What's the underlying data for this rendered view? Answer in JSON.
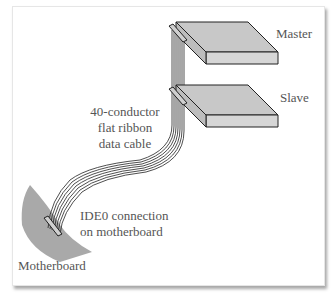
{
  "diagram": {
    "labels": {
      "master": "Master",
      "slave": "Slave",
      "cable_line1": "40-conductor",
      "cable_line2": "flat ribbon",
      "cable_line3": "data cable",
      "ide_line1": "IDE0 connection",
      "ide_line2": "on motherboard",
      "motherboard": "Motherboard"
    },
    "colors": {
      "drive_fill": "#c8c8c8",
      "drive_side": "#d6d6d6",
      "motherboard_fill": "#a9a9a9",
      "stroke": "#222222",
      "label_text": "#555555"
    }
  }
}
